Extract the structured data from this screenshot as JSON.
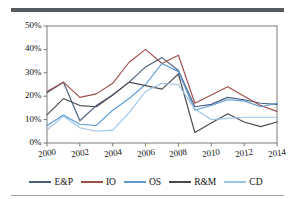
{
  "chart_data": {
    "type": "line",
    "title": "",
    "subtitle": "",
    "xlabel": "",
    "ylabel": "",
    "x": [
      2000,
      2001,
      2002,
      2003,
      2004,
      2005,
      2006,
      2007,
      2008,
      2009,
      2010,
      2011,
      2012,
      2013,
      2014
    ],
    "xlim": [
      2000,
      2014
    ],
    "ylim": [
      0,
      50
    ],
    "yticks": [
      0,
      10,
      20,
      30,
      40,
      50
    ],
    "ytick_labels": [
      "0%",
      "10%",
      "20%",
      "30%",
      "40%",
      "50%"
    ],
    "xticks": [
      2000,
      2002,
      2004,
      2006,
      2008,
      2010,
      2012,
      2014
    ],
    "xtick_labels": [
      "2000",
      "2002",
      "2004",
      "2006",
      "2008",
      "2010",
      "2012",
      "2014"
    ],
    "grid": false,
    "legend_position": "bottom",
    "series": [
      {
        "name": "E&P",
        "color": "#4a5e80",
        "values": [
          21.5,
          26.0,
          9.5,
          16.0,
          20.5,
          26.0,
          32.5,
          36.5,
          31.0,
          15.5,
          16.5,
          19.5,
          18.5,
          17.0,
          16.5
        ]
      },
      {
        "name": "IO",
        "color": "#9e4f49",
        "values": [
          22.0,
          26.0,
          19.5,
          21.0,
          25.5,
          34.5,
          40.0,
          34.0,
          37.5,
          17.0,
          20.5,
          24.0,
          20.0,
          16.0,
          13.5
        ]
      },
      {
        "name": "OS",
        "color": "#5b9bd5",
        "values": [
          7.5,
          12.0,
          8.0,
          7.5,
          14.0,
          19.0,
          25.0,
          34.0,
          30.5,
          14.0,
          16.0,
          18.5,
          18.0,
          15.5,
          17.0
        ]
      },
      {
        "name": "R&M",
        "color": "#4a4a52",
        "values": [
          12.0,
          19.0,
          16.0,
          15.5,
          20.5,
          26.0,
          24.5,
          23.0,
          29.5,
          4.5,
          8.5,
          12.5,
          9.0,
          7.0,
          9.0
        ]
      },
      {
        "name": "CD",
        "color": "#9dc3e6",
        "values": [
          5.5,
          11.5,
          6.5,
          5.0,
          5.5,
          13.0,
          22.0,
          25.5,
          25.0,
          14.5,
          10.0,
          10.5,
          11.0,
          11.0,
          11.0
        ]
      }
    ]
  },
  "legend": {
    "entries": [
      {
        "label": "E&P"
      },
      {
        "label": "IO"
      },
      {
        "label": "OS"
      },
      {
        "label": "R&M"
      },
      {
        "label": "CD"
      }
    ]
  },
  "colors": {
    "axis": "#6d6d6d",
    "top_rule": "#555a5e",
    "bottom_rule": "#9aa0a6",
    "background": "#ffffff",
    "text": "#111111"
  }
}
